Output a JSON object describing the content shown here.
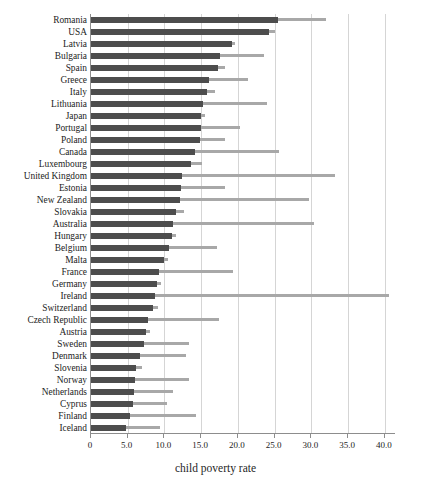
{
  "chart_data": {
    "type": "bar",
    "orientation": "horizontal",
    "title": "",
    "xlabel": "child poverty rate",
    "ylabel": "",
    "xlim": [
      0,
      41.5
    ],
    "xticks": [
      0,
      5.0,
      10.0,
      15.0,
      20.0,
      25.0,
      30.0,
      35.0,
      40.0
    ],
    "xtick_labels": [
      "0",
      "5.0",
      "10.0",
      "15.0",
      "20.0",
      "25.0",
      "30.0",
      "35.0",
      "40.0"
    ],
    "grid": "vertical",
    "legend": "none",
    "categories": [
      "Romania",
      "USA",
      "Latvia",
      "Bulgaria",
      "Spain",
      "Greece",
      "Italy",
      "Lithuania",
      "Japan",
      "Portugal",
      "Poland",
      "Canada",
      "Luxembourg",
      "United Kingdom",
      "Estonia",
      "New Zealand",
      "Slovakia",
      "Australia",
      "Hungary",
      "Belgium",
      "Malta",
      "France",
      "Germany",
      "Ireland",
      "Switzerland",
      "Czech Republic",
      "Austria",
      "Sweden",
      "Denmark",
      "Slovenia",
      "Norway",
      "Netherlands",
      "Cyprus",
      "Finland",
      "Iceland"
    ],
    "series": [
      {
        "name": "child poverty rate",
        "color": "#4d4d4d",
        "values": [
          25.5,
          24.2,
          19.2,
          17.5,
          17.3,
          16.0,
          15.8,
          15.2,
          15.0,
          14.9,
          14.8,
          14.1,
          13.6,
          12.4,
          12.2,
          12.1,
          11.6,
          11.2,
          11.0,
          10.6,
          10.0,
          9.2,
          9.0,
          8.7,
          8.5,
          7.8,
          7.5,
          7.2,
          6.6,
          6.1,
          6.0,
          5.9,
          5.7,
          5.3,
          4.8
        ]
      },
      {
        "name": "upper extent",
        "color": "#a8a8a8",
        "values": [
          32.0,
          25.0,
          19.6,
          23.5,
          18.3,
          21.3,
          16.9,
          23.9,
          15.5,
          20.3,
          18.2,
          25.6,
          15.1,
          33.2,
          18.3,
          29.6,
          12.7,
          30.4,
          11.6,
          17.1,
          10.5,
          19.3,
          9.5,
          40.5,
          9.1,
          17.4,
          8.0,
          13.3,
          12.9,
          7.0,
          13.3,
          11.2,
          10.4,
          14.3,
          9.4
        ]
      }
    ]
  }
}
